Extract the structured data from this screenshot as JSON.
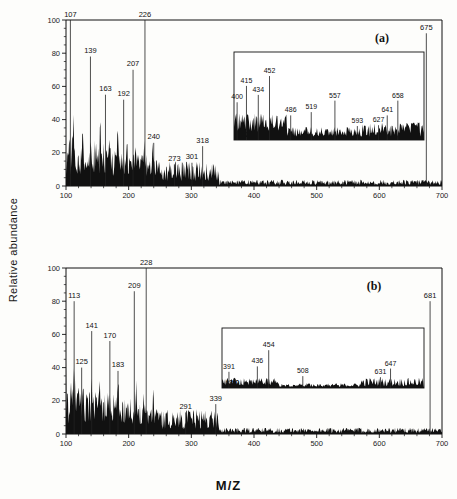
{
  "figure": {
    "ylabel": "Relative abundance",
    "xlabel": "M/Z"
  },
  "axes": {
    "y_ticks": [
      "100",
      "80",
      "60",
      "40",
      "20",
      "0"
    ],
    "y_values": [
      100,
      80,
      60,
      40,
      20,
      0
    ],
    "x_ticks": [
      "100",
      "200",
      "300",
      "400",
      "500",
      "600",
      "700"
    ],
    "x_values": [
      100,
      200,
      300,
      400,
      500,
      600,
      700
    ],
    "xlim": [
      100,
      700
    ],
    "ylim": [
      0,
      100
    ],
    "grid": false
  },
  "panels": [
    {
      "tag": "(a)",
      "inset": {
        "magnification": "*12.0",
        "xlim": [
          395,
          700
        ],
        "labels": [
          "400",
          "415",
          "434",
          "452",
          "486",
          "519",
          "557",
          "593",
          "627",
          "641",
          "658"
        ],
        "values": [
          400,
          415,
          434,
          452,
          486,
          519,
          557,
          593,
          627,
          641,
          658
        ],
        "heights": [
          46,
          66,
          55,
          78,
          30,
          34,
          48,
          17,
          18,
          30,
          48
        ]
      },
      "labels": [
        "107",
        "139",
        "163",
        "192",
        "207",
        "226",
        "240",
        "273",
        "301",
        "318",
        "675"
      ],
      "values": [
        107,
        139,
        163,
        192,
        207,
        226,
        240,
        273,
        301,
        318,
        675
      ],
      "heights": [
        100,
        78,
        55,
        52,
        70,
        100,
        26,
        13,
        14,
        24,
        92
      ]
    },
    {
      "tag": "(b)",
      "inset": {
        "magnification": "*3.0",
        "xlim": [
          380,
          700
        ],
        "labels": [
          "391",
          "436",
          "454",
          "508",
          "631",
          "647"
        ],
        "values": [
          391,
          436,
          454,
          508,
          631,
          647
        ],
        "heights": [
          30,
          40,
          70,
          22,
          20,
          36
        ]
      },
      "labels": [
        "113",
        "125",
        "141",
        "170",
        "183",
        "209",
        "228",
        "291",
        "339",
        "681"
      ],
      "values": [
        113,
        125,
        141,
        170,
        183,
        209,
        228,
        291,
        339,
        681
      ],
      "heights": [
        80,
        40,
        62,
        56,
        38,
        86,
        100,
        13,
        18,
        80
      ]
    }
  ],
  "chart_data": {
    "type": "line",
    "title": "",
    "xlabel": "M/Z",
    "ylabel": "Relative abundance",
    "xlim": [
      100,
      700
    ],
    "ylim": [
      0,
      100
    ],
    "grid": false,
    "series": [
      {
        "name": "(a)",
        "x": [
          107,
          139,
          163,
          192,
          207,
          226,
          240,
          273,
          301,
          318,
          675
        ],
        "values": [
          100,
          78,
          55,
          52,
          70,
          100,
          26,
          13,
          14,
          24,
          92
        ]
      },
      {
        "name": "(a) inset *12.0",
        "x": [
          400,
          415,
          434,
          452,
          486,
          519,
          557,
          593,
          627,
          641,
          658
        ],
        "values": [
          46,
          66,
          55,
          78,
          30,
          34,
          48,
          17,
          18,
          30,
          48
        ]
      },
      {
        "name": "(b)",
        "x": [
          113,
          125,
          141,
          170,
          183,
          209,
          228,
          291,
          339,
          681
        ],
        "values": [
          80,
          40,
          62,
          56,
          38,
          86,
          100,
          13,
          18,
          80
        ]
      },
      {
        "name": "(b) inset *3.0",
        "x": [
          391,
          436,
          454,
          508,
          631,
          647
        ],
        "values": [
          30,
          40,
          70,
          22,
          20,
          36
        ]
      }
    ]
  }
}
